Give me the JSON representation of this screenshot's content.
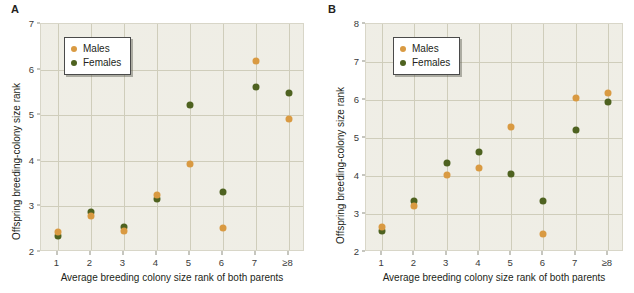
{
  "figure": {
    "panels": [
      {
        "label": "A",
        "legend": [
          {
            "name": "males",
            "label": "Males",
            "color": "#d99a42"
          },
          {
            "name": "females",
            "label": "Females",
            "color": "#4e6220"
          }
        ],
        "chart_data": {
          "type": "scatter",
          "title": "",
          "xlabel": "Average breeding colony size rank of both parents",
          "ylabel": "Offspring breeding-colony size rank",
          "categories": [
            "1",
            "2",
            "3",
            "4",
            "5",
            "6",
            "7",
            "≥8"
          ],
          "xticklabels": [
            "1",
            "2",
            "3",
            "4",
            "5",
            "6",
            "7",
            "≥8"
          ],
          "yticklabels": [
            "2",
            "3",
            "4",
            "5",
            "6",
            "7"
          ],
          "ylim": [
            2,
            7
          ],
          "grid": true,
          "legend_position": "upper left",
          "series": [
            {
              "name": "Males",
              "color": "#d99a42",
              "values": [
                2.44,
                2.8,
                2.46,
                3.24,
                3.92,
                2.53,
                6.18,
                4.91
              ]
            },
            {
              "name": "Females",
              "color": "#4e6220",
              "values": [
                2.36,
                2.87,
                2.55,
                3.17,
                5.23,
                3.31,
                5.62,
                5.48
              ]
            }
          ]
        }
      },
      {
        "label": "B",
        "legend": [
          {
            "name": "males",
            "label": "Males",
            "color": "#d99a42"
          },
          {
            "name": "females",
            "label": "Females",
            "color": "#4e6220"
          }
        ],
        "chart_data": {
          "type": "scatter",
          "title": "",
          "xlabel": "Average breeding colony size rank of both parents",
          "ylabel": "Offspring breeding-colony size rank",
          "categories": [
            "1",
            "2",
            "3",
            "4",
            "5",
            "6",
            "7",
            "≥8"
          ],
          "xticklabels": [
            "1",
            "2",
            "3",
            "4",
            "5",
            "6",
            "7",
            "≥8"
          ],
          "yticklabels": [
            "2",
            "3",
            "4",
            "5",
            "6",
            "7",
            "8"
          ],
          "ylim": [
            2,
            8
          ],
          "grid": true,
          "legend_position": "upper left",
          "series": [
            {
              "name": "Males",
              "color": "#d99a42",
              "values": [
                2.67,
                3.22,
                4.03,
                4.2,
                5.3,
                2.47,
                6.05,
                6.18
              ]
            },
            {
              "name": "Females",
              "color": "#4e6220",
              "values": [
                2.56,
                3.35,
                4.35,
                4.63,
                4.06,
                3.33,
                5.2,
                5.96
              ]
            }
          ]
        }
      }
    ]
  }
}
